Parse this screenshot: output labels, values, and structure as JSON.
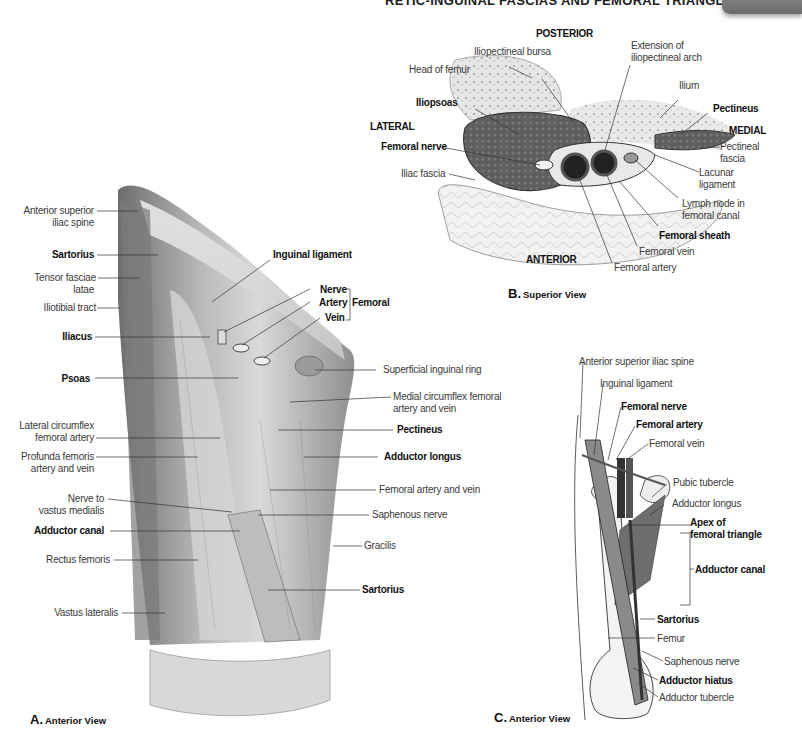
{
  "header": {
    "title": "RETIC-INGUINAL FASCIAS AND FEMORAL TRIANGLE",
    "page_number": "831"
  },
  "figure_b": {
    "caption_letter": "B.",
    "caption_text": "Superior View",
    "orientation": {
      "posterior": "POSTERIOR",
      "anterior": "ANTERIOR",
      "lateral": "LATERAL",
      "medial": "MEDIAL"
    },
    "labels": {
      "iliopectineal_bursa": "Iliopectineal bursa",
      "extension_arch_1": "Extension of",
      "extension_arch_2": "iliopectineal arch",
      "head_of_femur": "Head of femur",
      "ilium": "Ilium",
      "iliopsoas": "Iliopsoas",
      "pectineus": "Pectineus",
      "femoral_nerve": "Femoral nerve",
      "pectineal_fascia_1": "Pectineal",
      "pectineal_fascia_2": "fascia",
      "iliac_fascia": "Iliac fascia",
      "lacunar_ligament_1": "Lacunar",
      "lacunar_ligament_2": "ligament",
      "lymph_node_1": "Lymph node in",
      "lymph_node_2": "femoral canal",
      "femoral_sheath": "Femoral sheath",
      "femoral_vein": "Femoral vein",
      "femoral_artery": "Femoral artery"
    }
  },
  "figure_a": {
    "caption_letter": "A.",
    "caption_text": "Anterior View",
    "labels_left": {
      "asis_1": "Anterior superior",
      "asis_2": "iliac spine",
      "sartorius": "Sartorius",
      "tfl_1": "Tensor fasciae",
      "tfl_2": "latae",
      "iliotibial_tract": "Iliotibial tract",
      "iliacus": "Iliacus",
      "psoas": "Psoas",
      "lcfa_1": "Lateral circumflex",
      "lcfa_2": "femoral artery",
      "profunda_1": "Profunda femoris",
      "profunda_2": "artery and vein",
      "nerve_vm_1": "Nerve to",
      "nerve_vm_2": "vastus medialis",
      "adductor_canal": "Adductor canal",
      "rectus_femoris": "Rectus femoris",
      "vastus_lateralis": "Vastus lateralis"
    },
    "labels_right": {
      "inguinal_ligament": "Inguinal ligament",
      "nerve": "Nerve",
      "artery": "Artery",
      "vein": "Vein",
      "femoral_group": "Femoral",
      "superficial_ring": "Superficial inguinal ring",
      "mcfa_1": "Medial circumflex femoral",
      "mcfa_2": "artery and vein",
      "pectineus": "Pectineus",
      "adductor_longus": "Adductor longus",
      "femoral_av": "Femoral artery and vein",
      "saphenous_nerve": "Saphenous nerve",
      "gracilis": "Gracilis",
      "sartorius": "Sartorius"
    }
  },
  "figure_c": {
    "caption_letter": "C.",
    "caption_text": "Anterior View",
    "labels": {
      "asis": "Anterior superior iliac spine",
      "inguinal_ligament": "Inguinal ligament",
      "femoral_nerve": "Femoral nerve",
      "femoral_artery": "Femoral artery",
      "femoral_vein": "Femoral vein",
      "pubic_tubercle": "Pubic tubercle",
      "adductor_longus": "Adductor longus",
      "apex_1": "Apex of",
      "apex_2": "femoral triangle",
      "adductor_canal": "Adductor canal",
      "sartorius": "Sartorius",
      "femur": "Femur",
      "saphenous_nerve": "Saphenous nerve",
      "adductor_hiatus": "Adductor hiatus",
      "adductor_tubercle": "Adductor tubercle"
    }
  }
}
